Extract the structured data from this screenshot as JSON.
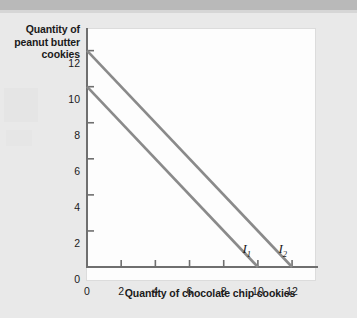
{
  "figure": {
    "y_axis_title": "Quantity of peanut butter cookies",
    "y_axis_title_lines": [
      "Quantity of",
      "peanut butter",
      "cookies"
    ],
    "x_axis_title": "Quantity of chocolate chip cookies"
  },
  "colors": {
    "curve": "#8a8a8a",
    "axis": "#6f6f6f",
    "plot_background": "#fdfdfd",
    "page_background": "#e9e9e9",
    "top_band": "#b9b9b9",
    "text": "#1a1a1a"
  },
  "chart_data": {
    "type": "line",
    "title": "",
    "xlabel": "Quantity of chocolate chip cookies",
    "ylabel": "Quantity of peanut butter cookies",
    "xlim": [
      0,
      13.4
    ],
    "ylim": [
      0,
      13.2
    ],
    "xticks": [
      0,
      2,
      4,
      6,
      8,
      10,
      12
    ],
    "yticks": [
      0,
      2,
      4,
      6,
      8,
      10,
      12
    ],
    "xtick_labels": [
      "0",
      "2",
      "4",
      "6",
      "8",
      "10",
      "12"
    ],
    "ytick_labels": [
      "0",
      "2",
      "4",
      "6",
      "8",
      "10",
      "12"
    ],
    "grid": false,
    "legend": "inline-endpoint-labels",
    "series": [
      {
        "name": "I1",
        "label": "I",
        "subscript": "1",
        "color": "#8a8a8a",
        "x": [
          0,
          10
        ],
        "y": [
          10,
          0
        ],
        "slope": -1,
        "x_intercept": 10,
        "y_intercept": 10,
        "label_x": 9.1,
        "label_y": 0.95
      },
      {
        "name": "I2",
        "label": "I",
        "subscript": "2",
        "color": "#8a8a8a",
        "x": [
          0,
          12
        ],
        "y": [
          12,
          0
        ],
        "slope": -1,
        "x_intercept": 12,
        "y_intercept": 12,
        "label_x": 11.2,
        "label_y": 0.95
      }
    ],
    "annotations": []
  }
}
